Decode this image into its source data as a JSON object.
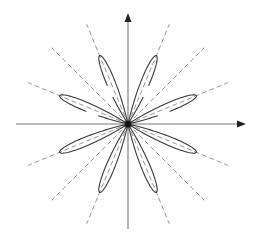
{
  "diagram": {
    "type": "polar-rose",
    "center": [
      128,
      124
    ],
    "axes": {
      "x": {
        "from": 16,
        "to": 246,
        "arrow": true
      },
      "y": {
        "from": 229,
        "to": 13,
        "arrow": true
      }
    },
    "petals": {
      "count": 8,
      "angles_deg": [
        22.5,
        67.5,
        112.5,
        157.5,
        202.5,
        247.5,
        292.5,
        337.5
      ],
      "length": 74,
      "half_width_deg": 9.5,
      "open_gap_petals_deg": [
        22.5,
        67.5,
        112.5,
        157.5
      ]
    },
    "rays": {
      "style": "dashed",
      "angles_deg": [
        22.5,
        45,
        67.5,
        112.5,
        135,
        157.5,
        202.5,
        225,
        247.5,
        292.5,
        315,
        337.5
      ],
      "length": 108
    },
    "colors": {
      "axis": "#777777",
      "ray": "#8a8a8a",
      "petal": "#3a3a3a",
      "hub": "#111111"
    }
  }
}
